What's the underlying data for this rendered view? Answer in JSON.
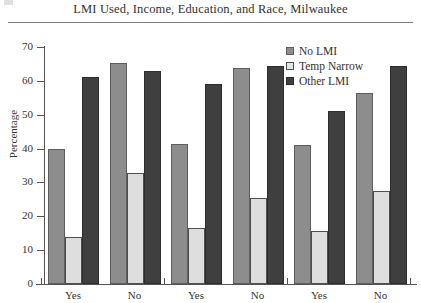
{
  "chart_data": {
    "type": "bar",
    "title": "LMI Used, Income, Education, and Race, Milwaukee",
    "xlabel": "",
    "ylabel": "Percentage",
    "ylim": [
      0,
      70
    ],
    "yticks": [
      0,
      10,
      20,
      30,
      40,
      50,
      60,
      70
    ],
    "grid": false,
    "legend_position": "top-right",
    "categories": [
      "Yes",
      "No",
      "Yes",
      "No",
      "Yes",
      "No"
    ],
    "series": [
      {
        "name": "No LMI",
        "color": "#8d8d8d",
        "values": [
          40.0,
          65.3,
          41.5,
          63.7,
          41.2,
          56.5
        ]
      },
      {
        "name": "Temp Narrow",
        "color": "#dedede",
        "values": [
          13.9,
          32.8,
          16.4,
          25.5,
          15.6,
          27.5
        ]
      },
      {
        "name": "Other LMI",
        "color": "#3f3f40",
        "values": [
          61.0,
          62.8,
          59.0,
          64.5,
          51.0,
          64.5
        ]
      }
    ]
  },
  "legend": {
    "items": [
      {
        "label": "No LMI"
      },
      {
        "label": "Temp Narrow"
      },
      {
        "label": "Other LMI"
      }
    ]
  }
}
